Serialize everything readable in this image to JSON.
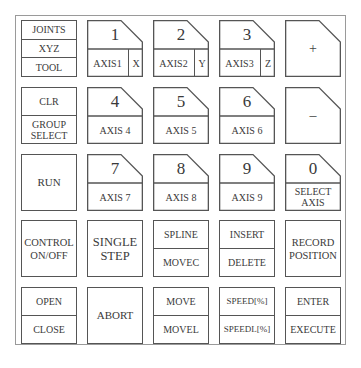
{
  "keypad": {
    "row1": {
      "mode": {
        "items": [
          "JOINTS",
          "XYZ",
          "TOOL"
        ]
      },
      "k1": {
        "digit": "1",
        "axis": "AXIS1",
        "coord": "X"
      },
      "k2": {
        "digit": "2",
        "axis": "AXIS2",
        "coord": "Y"
      },
      "k3": {
        "digit": "3",
        "axis": "AXIS3",
        "coord": "Z"
      },
      "plus": {
        "symbol": "+"
      }
    },
    "row2": {
      "clr": {
        "top": "CLR",
        "bottom_line1": "GROUP",
        "bottom_line2": "SELECT"
      },
      "k4": {
        "digit": "4",
        "axis": "AXIS 4"
      },
      "k5": {
        "digit": "5",
        "axis": "AXIS 5"
      },
      "k6": {
        "digit": "6",
        "axis": "AXIS 6"
      },
      "minus": {
        "symbol": "–"
      }
    },
    "row3": {
      "run": {
        "label": "RUN"
      },
      "k7": {
        "digit": "7",
        "axis": "AXIS 7"
      },
      "k8": {
        "digit": "8",
        "axis": "AXIS 8"
      },
      "k9": {
        "digit": "9",
        "axis": "AXIS 9"
      },
      "k0": {
        "digit": "0",
        "line1": "SELECT",
        "line2": "AXIS"
      }
    },
    "row4": {
      "control": {
        "line1": "CONTROL",
        "line2": "ON/OFF"
      },
      "single_step": {
        "line1": "SINGLE",
        "line2": "STEP"
      },
      "spline": {
        "top": "SPLINE",
        "bottom": "MOVEC"
      },
      "insert": {
        "top": "INSERT",
        "bottom": "DELETE"
      },
      "record": {
        "line1": "RECORD",
        "line2": "POSITION"
      }
    },
    "row5": {
      "open": {
        "top": "OPEN",
        "bottom": "CLOSE"
      },
      "abort": {
        "label": "ABORT"
      },
      "move": {
        "top": "MOVE",
        "bottom": "MOVEL"
      },
      "speed": {
        "top": "SPEED[%]",
        "bottom": "SPEEDL[%]"
      },
      "enter": {
        "top": "ENTER",
        "bottom": "EXECUTE"
      }
    }
  }
}
